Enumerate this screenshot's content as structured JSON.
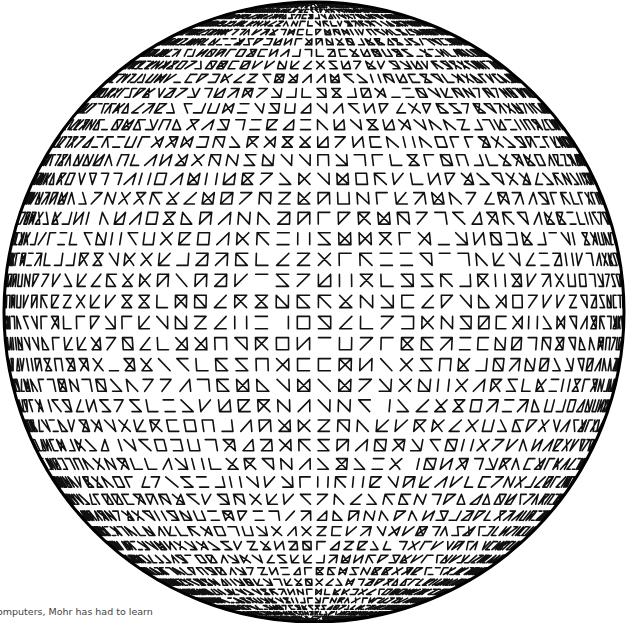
{
  "artwork": {
    "subject": "sphere covered with line-glyph grid",
    "sphere": {
      "cx": 314,
      "cy": 312,
      "r": 310,
      "outline_color": "#000000",
      "outline_width": 3
    },
    "grid": {
      "lat_steps": 46,
      "lon_steps": 46,
      "glyph_fill": 0.58,
      "stroke_color": "#111111",
      "seed": 7
    },
    "glyph_segments": [
      "top",
      "bottom",
      "left",
      "right",
      "diag_down",
      "diag_up"
    ],
    "colors": {
      "background": "#ffffff",
      "ink": "#111111",
      "caption": "#444444"
    }
  },
  "caption": {
    "text": "omputers, Mohr has had to learn"
  }
}
